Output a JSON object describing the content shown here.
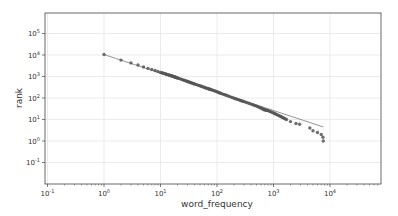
{
  "chart_data": {
    "type": "scatter",
    "title": "",
    "xlabel": "word_frequency",
    "ylabel": "rank",
    "xscale": "log",
    "yscale": "log",
    "xlim": [
      0.1,
      60000
    ],
    "ylim": [
      0.01,
      1000000
    ],
    "grid": true,
    "legend": null,
    "x_ticks": [
      {
        "exp": "-1",
        "value": 0.1
      },
      {
        "exp": "0",
        "value": 1
      },
      {
        "exp": "1",
        "value": 10
      },
      {
        "exp": "2",
        "value": 100
      },
      {
        "exp": "3",
        "value": 1000
      },
      {
        "exp": "4",
        "value": 10000
      }
    ],
    "y_ticks": [
      {
        "exp": "5",
        "value": 100000
      },
      {
        "exp": "4",
        "value": 10000
      },
      {
        "exp": "3",
        "value": 1000
      },
      {
        "exp": "2",
        "value": 100
      },
      {
        "exp": "1",
        "value": 10
      },
      {
        "exp": "0",
        "value": 1
      },
      {
        "exp": "-1",
        "value": 0.1
      }
    ],
    "series": [
      {
        "name": "observed",
        "style": "markers",
        "color": "#555555",
        "points": [
          [
            1,
            10500
          ],
          [
            2,
            5800
          ],
          [
            3,
            4300
          ],
          [
            4,
            3400
          ],
          [
            5,
            2800
          ],
          [
            6,
            2400
          ],
          [
            7,
            2100
          ],
          [
            8,
            1900
          ],
          [
            9,
            1700
          ],
          [
            10,
            1550
          ],
          [
            12,
            1350
          ],
          [
            14,
            1180
          ],
          [
            16,
            1050
          ],
          [
            18,
            950
          ],
          [
            20,
            860
          ],
          [
            25,
            700
          ],
          [
            30,
            590
          ],
          [
            35,
            510
          ],
          [
            40,
            450
          ],
          [
            50,
            370
          ],
          [
            60,
            310
          ],
          [
            70,
            270
          ],
          [
            80,
            240
          ],
          [
            100,
            195
          ],
          [
            120,
            160
          ],
          [
            150,
            130
          ],
          [
            200,
            98
          ],
          [
            250,
            80
          ],
          [
            300,
            68
          ],
          [
            400,
            52
          ],
          [
            500,
            42
          ],
          [
            600,
            34
          ],
          [
            700,
            28
          ],
          [
            800,
            26
          ],
          [
            1000,
            20
          ],
          [
            1200,
            16
          ],
          [
            1400,
            13
          ],
          [
            1700,
            10
          ],
          [
            2000,
            8
          ],
          [
            2500,
            6.5
          ],
          [
            2900,
            6
          ],
          [
            4400,
            4
          ],
          [
            5000,
            3
          ],
          [
            6000,
            2.5
          ],
          [
            7000,
            2
          ],
          [
            7500,
            1.5
          ],
          [
            7600,
            1
          ]
        ]
      },
      {
        "name": "fit",
        "style": "line",
        "color": "#888888",
        "points": [
          [
            1,
            10500
          ],
          [
            7600,
            4.5
          ]
        ]
      }
    ]
  }
}
